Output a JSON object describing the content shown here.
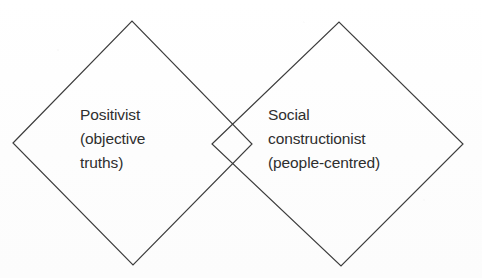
{
  "diagram": {
    "background_color": "#fefefe",
    "stroke_color": "#3c3c3c",
    "text_color": "#2e2e2e",
    "shapes": [
      {
        "name": "positivist-diamond",
        "points": "13,143 132,21 252,144 133,265"
      },
      {
        "name": "social-constructionist-diamond",
        "points": "212,144 339,22 463,144 341,266"
      }
    ],
    "labels": {
      "left": {
        "line1": "Positivist",
        "line2": "(objective",
        "line3": "truths)"
      },
      "right": {
        "line1": "Social",
        "line2": "constructionist",
        "line3": "(people-centred)"
      }
    }
  }
}
